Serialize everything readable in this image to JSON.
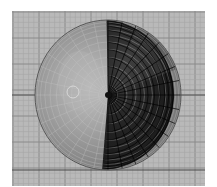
{
  "viewport": {
    "name": "3D viewport - top view",
    "background_color": "#b9b9b9",
    "grid_minor_color": "#a6a6a6",
    "grid_major_color": "#8a8a8a",
    "axis_color": "#4a4a4a"
  },
  "object": {
    "type": "UV sphere",
    "view": "top",
    "lit_color": "#9a9a9a",
    "highlight_color": "#b4b4b4",
    "shadow_color": "#1e1e1e",
    "wire_color": "#c8c8c8",
    "dark_wire_color": "#000000",
    "segments": 32,
    "rings": 12
  },
  "pivot": {
    "name": "object origin / 3D cursor"
  }
}
